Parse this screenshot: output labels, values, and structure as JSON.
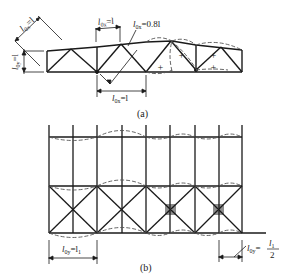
{
  "figure_a": {
    "caption": "(a)",
    "labels": {
      "l0y_left": "l",
      "l0y_left_sub": "0y",
      "l0y_left_eq": "=l",
      "l0x_diag": "l",
      "l0x_diag_sub": "0x",
      "l0x_diag_eq": "=l",
      "l0x_top": "l",
      "l0x_top_sub": "0x",
      "l0x_top_eq": "=l",
      "l0x_08": "l",
      "l0x_08_sub": "0x",
      "l0x_08_eq": "=0.8l",
      "l0x_bottom": "l",
      "l0x_bottom_sub": "0x",
      "l0x_bottom_eq": "=l"
    },
    "signs": [
      "+",
      "+",
      "+",
      "+"
    ]
  },
  "figure_b": {
    "caption": "(b)",
    "labels": {
      "l0y_left": "l",
      "l0y_left_sub": "0y",
      "l0y_left_eq": "=l",
      "l0y_left_rhs_sub": "1",
      "l0y_right": "l",
      "l0y_right_sub": "0y",
      "l0y_right_eq": "=",
      "l0y_right_num": "l",
      "l0y_right_num_sub": "1",
      "l0y_right_den": "2"
    }
  },
  "colors": {
    "line": "#1a1a1a",
    "dash": "#555555",
    "background": "#ffffff"
  }
}
